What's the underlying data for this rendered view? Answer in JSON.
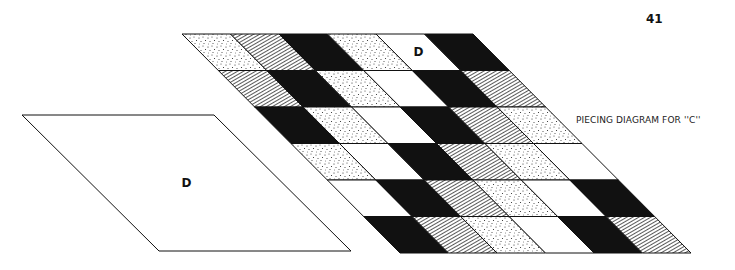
{
  "page": {
    "page_number": "41",
    "caption": "PIECING DIAGRAM FOR ''C''"
  },
  "template_piece": {
    "label": "D",
    "points": [
      [
        22,
        115
      ],
      [
        214,
        115
      ],
      [
        351,
        251
      ],
      [
        159,
        251
      ]
    ]
  },
  "quilt_grid": {
    "rows": 6,
    "cols": 6,
    "top_left": [
      182,
      34
    ],
    "top_right": [
      473,
      34
    ],
    "bottom_left": [
      400,
      253
    ],
    "highlight_label": "D",
    "highlight_cell": [
      0,
      4
    ],
    "fills": [
      [
        "stipple",
        "hatch",
        "black",
        "stipple",
        "white",
        "black"
      ],
      [
        "hatch",
        "black",
        "stipple",
        "white",
        "black",
        "hatch"
      ],
      [
        "black",
        "stipple",
        "white",
        "black",
        "hatch",
        "stipple"
      ],
      [
        "stipple",
        "white",
        "black",
        "hatch",
        "stipple",
        "white"
      ],
      [
        "white",
        "black",
        "hatch",
        "stipple",
        "white",
        "black"
      ],
      [
        "black",
        "hatch",
        "stipple",
        "white",
        "black",
        "hatch"
      ]
    ]
  },
  "colors": {
    "ink": "#111111",
    "paper": "#ffffff"
  }
}
